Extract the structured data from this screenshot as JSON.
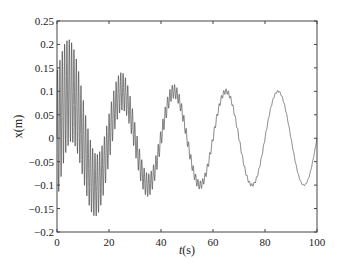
{
  "chart_data": {
    "type": "line",
    "title": "",
    "xlabel": "t(s)",
    "xlabel_italic_part": "t",
    "xlabel_rest": "(s)",
    "ylabel": "x(m)",
    "xlim": [
      0,
      100
    ],
    "ylim": [
      -0.2,
      0.25
    ],
    "xticks": [
      0,
      20,
      40,
      60,
      80,
      100
    ],
    "xtick_labels": [
      "0",
      "20",
      "40",
      "60",
      "80",
      "100"
    ],
    "yticks": [
      -0.2,
      -0.15,
      -0.1,
      -0.05,
      0,
      0.05,
      0.1,
      0.15,
      0.2,
      0.25
    ],
    "ytick_labels": [
      "-0.2",
      "-0.15",
      "-0.1",
      "-0.05",
      "0",
      "0.05",
      "0.1",
      "0.15",
      "0.2",
      "0.25"
    ],
    "grid": false,
    "legend": null,
    "series": [
      {
        "name": "x(t)",
        "color": "#333333",
        "description": "Slow oscillation (period ~20 s, amplitude ~0.1 m) plus decaying high-frequency component",
        "model": {
          "slow_amplitude": 0.1,
          "slow_period": 20,
          "fast_amplitude": 0.14,
          "fast_decay": 0.05,
          "fast_period": 0.9
        },
        "peaks": [
          {
            "t": 5,
            "x": 0.21
          },
          {
            "t": 25,
            "x": 0.14
          },
          {
            "t": 45,
            "x": 0.11
          },
          {
            "t": 65,
            "x": 0.1
          },
          {
            "t": 85,
            "x": 0.1
          }
        ],
        "troughs": [
          {
            "t": 15,
            "x": -0.165
          },
          {
            "t": 35,
            "x": -0.13
          },
          {
            "t": 55,
            "x": -0.105
          },
          {
            "t": 75,
            "x": -0.1
          },
          {
            "t": 95,
            "x": -0.1
          }
        ]
      }
    ]
  },
  "layout": {
    "plot_left": 57,
    "plot_right": 317,
    "plot_top": 21,
    "plot_bottom": 232
  }
}
